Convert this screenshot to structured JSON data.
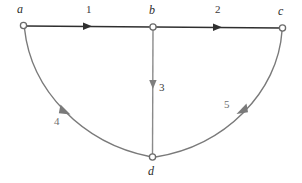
{
  "figure": {
    "type": "directed-graph-diagram",
    "width": 302,
    "height": 183,
    "background": "#ffffff"
  },
  "colors": {
    "straight_edge": "#2f2f2f",
    "curved_edge": "#7a7a7a",
    "vertical_edge": "#8a8a8a",
    "node_stroke": "#6b6b6b",
    "node_fill": "#ffffff",
    "label_text": "#2b2b2b",
    "edge_label_text": "#3a3a3a"
  },
  "nodes": [
    {
      "id": "a",
      "label": "a",
      "x": 23,
      "y": 25,
      "label_x": 17,
      "label_y": 4,
      "r": 3.2
    },
    {
      "id": "b",
      "label": "b",
      "x": 153,
      "y": 27,
      "label_x": 149,
      "label_y": 5,
      "r": 3.2
    },
    {
      "id": "c",
      "label": "c",
      "x": 283,
      "y": 28,
      "label_x": 278,
      "label_y": 6,
      "r": 3.2
    },
    {
      "id": "d",
      "label": "d",
      "x": 152,
      "y": 157,
      "label_x": 148,
      "label_y": 166,
      "r": 3.2
    }
  ],
  "edges": [
    {
      "id": "e1",
      "from": "a",
      "to": "b",
      "label": "1",
      "shape": "straight",
      "style": "dark",
      "label_x": 86,
      "label_y": 5,
      "arrow_x": 88,
      "arrow_y": 26,
      "arrow_angle": 0
    },
    {
      "id": "e2",
      "from": "b",
      "to": "c",
      "label": "2",
      "shape": "straight",
      "style": "dark",
      "label_x": 215,
      "label_y": 5,
      "arrow_x": 218,
      "arrow_y": 27,
      "arrow_angle": 0
    },
    {
      "id": "e3",
      "from": "b",
      "to": "d",
      "label": "3",
      "shape": "straight",
      "style": "gray",
      "label_x": 160,
      "label_y": 82,
      "arrow_x": 153,
      "arrow_y": 88,
      "arrow_angle": 90
    },
    {
      "id": "e4",
      "from": "a",
      "to": "d",
      "label": "4",
      "shape": "curve",
      "style": "gray",
      "label_x": 55,
      "label_y": 116,
      "arrow_x": 67,
      "arrow_y": 111,
      "arrow_angle": 48
    },
    {
      "id": "e5",
      "from": "c",
      "to": "d",
      "label": "5",
      "shape": "curve",
      "style": "gray",
      "label_x": 224,
      "label_y": 99,
      "arrow_x": 240,
      "arrow_y": 110,
      "arrow_angle": 132
    }
  ],
  "node_labels": {
    "a": "a",
    "b": "b",
    "c": "c",
    "d": "d"
  },
  "edge_labels": {
    "ab": "1",
    "bc": "2",
    "bd": "3",
    "ad": "4",
    "cd": "5"
  }
}
